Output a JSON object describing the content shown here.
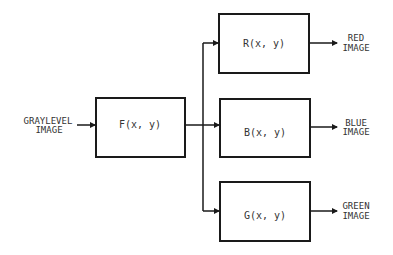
{
  "diagram": {
    "type": "block-diagram",
    "input": {
      "line1": "GRAYLEVEL",
      "line2": "IMAGE"
    },
    "blocks": {
      "f": {
        "label": "F(x, y)"
      },
      "r": {
        "label": "R(x, y)"
      },
      "b": {
        "label": "B(x, y)"
      },
      "g": {
        "label": "G(x, y)"
      }
    },
    "outputs": {
      "red": {
        "line1": "RED",
        "line2": "IMAGE"
      },
      "blue": {
        "line1": "BLUE",
        "line2": "IMAGE"
      },
      "green": {
        "line1": "GREEN",
        "line2": "IMAGE"
      }
    },
    "colors": {
      "stroke": "#1a1a1a",
      "text": "#333333",
      "background": "#ffffff"
    }
  }
}
